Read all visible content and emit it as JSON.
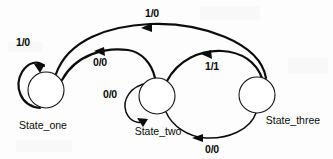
{
  "diagram": {
    "kind": "state-machine",
    "title": "",
    "width": 333,
    "height": 159,
    "background_color": "#fdfdfd",
    "stroke_color": "#0c0c0c",
    "states": [
      {
        "id": "state_one",
        "label": "State_one",
        "cx": 46,
        "cy": 90,
        "r": 18
      },
      {
        "id": "state_two",
        "label": "State_two",
        "cx": 157,
        "cy": 96,
        "r": 18
      },
      {
        "id": "state_three",
        "label": "State_three",
        "cx": 257,
        "cy": 95,
        "r": 18
      }
    ],
    "transitions": [
      {
        "id": "t1",
        "from": "state_one",
        "to": "state_one",
        "label": "1/0",
        "kind": "self-loop"
      },
      {
        "id": "t2",
        "from": "state_one",
        "to": "state_two",
        "label": "0/0",
        "kind": "arc"
      },
      {
        "id": "t3",
        "from": "state_two",
        "to": "state_two",
        "label": "0/0",
        "kind": "self-loop"
      },
      {
        "id": "t4",
        "from": "state_two",
        "to": "state_three",
        "label": "1/1",
        "kind": "arc"
      },
      {
        "id": "t5",
        "from": "state_three",
        "to": "state_two",
        "label": "0/0",
        "kind": "arc"
      },
      {
        "id": "t6",
        "from": "state_three",
        "to": "state_one",
        "label": "1/0",
        "kind": "arc"
      }
    ],
    "labels": {
      "self_loop_one": "1/0",
      "one_to_two": "0/0",
      "self_loop_two": "0/0",
      "two_to_three": "1/1",
      "three_to_two": "0/0",
      "three_to_one": "1/0",
      "state_one": "State_one",
      "state_two": "State_two",
      "state_three": "State_three"
    }
  }
}
